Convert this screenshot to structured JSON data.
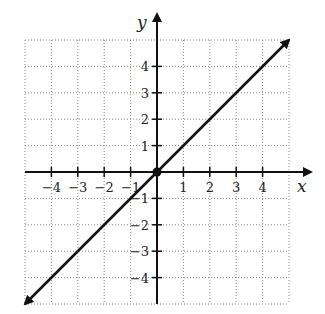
{
  "chart_data": {
    "type": "line",
    "title": "",
    "xlabel": "x",
    "ylabel": "y",
    "xlim": [
      -5,
      5
    ],
    "ylim": [
      -5,
      5
    ],
    "grid": true,
    "grid_style": "dotted",
    "x_ticks": [
      -4,
      -3,
      -2,
      -1,
      1,
      2,
      3,
      4
    ],
    "y_ticks": [
      -4,
      -3,
      -2,
      -1,
      1,
      2,
      3,
      4
    ],
    "x_tick_labels": [
      "−4",
      "−3",
      "−2",
      "−1",
      "1",
      "2",
      "3",
      "4"
    ],
    "y_tick_labels": [
      "−4",
      "−3",
      "−2",
      "−1",
      "1",
      "2",
      "3",
      "4"
    ],
    "series": [
      {
        "name": "y = x",
        "x": [
          -5,
          5
        ],
        "y": [
          -5,
          5
        ],
        "arrows": "both",
        "color": "#111111"
      }
    ],
    "points": [
      {
        "x": 0,
        "y": 0,
        "label": "origin",
        "filled": true
      }
    ],
    "legend": null
  },
  "labels": {
    "x_axis": "x",
    "y_axis": "y"
  }
}
